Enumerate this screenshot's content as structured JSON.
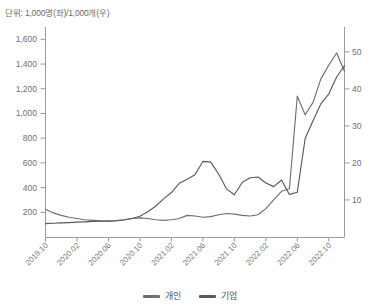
{
  "chart_data": {
    "type": "line",
    "title": "",
    "unit_note": "단위: 1,000명(좌)/1,000개(우)",
    "xlabel": "",
    "ylabel": "",
    "grid": false,
    "legend_position": "bottom-center",
    "x_tick_labels": [
      "2019.10",
      "2020.02",
      "2020.06",
      "2020.10",
      "2021.02",
      "2021.06",
      "2021.10",
      "2022.02",
      "2022.06",
      "2022.10"
    ],
    "x_period_start": "2019.10",
    "x_period_end": "2022.12",
    "left_axis": {
      "label": "1,000명",
      "ticks": [
        200,
        400,
        600,
        800,
        1000,
        1200,
        1400,
        1600
      ],
      "tick_labels": [
        "200",
        "400",
        "600",
        "800",
        "1,000",
        "1,200",
        "1,400",
        "1,600"
      ],
      "ylim": [
        0,
        1700
      ]
    },
    "right_axis": {
      "label": "1,000개",
      "ticks": [
        10,
        20,
        30,
        40,
        50
      ],
      "tick_labels": [
        "10",
        "20",
        "30",
        "40",
        "50"
      ],
      "ylim": [
        0,
        56.7
      ]
    },
    "series": [
      {
        "name": "개인",
        "axis": "left",
        "color": "#6e6e6e",
        "x": [
          "2019.10",
          "2019.11",
          "2019.12",
          "2020.01",
          "2020.02",
          "2020.03",
          "2020.04",
          "2020.05",
          "2020.06",
          "2020.07",
          "2020.08",
          "2020.09",
          "2020.10",
          "2020.11",
          "2020.12",
          "2021.01",
          "2021.02",
          "2021.03",
          "2021.04",
          "2021.05",
          "2021.06",
          "2021.07",
          "2021.08",
          "2021.09",
          "2021.10",
          "2021.11",
          "2021.12",
          "2022.01",
          "2022.02",
          "2022.03",
          "2022.04",
          "2022.05",
          "2022.06",
          "2022.07",
          "2022.08",
          "2022.09",
          "2022.10",
          "2022.11",
          "2022.12"
        ],
        "values": [
          225,
          195,
          175,
          160,
          150,
          140,
          135,
          130,
          128,
          132,
          140,
          150,
          155,
          150,
          140,
          135,
          140,
          150,
          175,
          170,
          160,
          165,
          180,
          190,
          185,
          175,
          170,
          180,
          230,
          300,
          370,
          390,
          1140,
          990,
          1090,
          1280,
          1390,
          1490,
          1340
        ]
      },
      {
        "name": "기업",
        "axis": "right",
        "color": "#5a5a5a",
        "x": [
          "2019.10",
          "2019.11",
          "2019.12",
          "2020.01",
          "2020.02",
          "2020.03",
          "2020.04",
          "2020.05",
          "2020.06",
          "2020.07",
          "2020.08",
          "2020.09",
          "2020.10",
          "2020.11",
          "2020.12",
          "2021.01",
          "2021.02",
          "2021.03",
          "2021.04",
          "2021.05",
          "2021.06",
          "2021.07",
          "2021.08",
          "2021.09",
          "2021.10",
          "2021.11",
          "2021.12",
          "2022.01",
          "2022.02",
          "2022.03",
          "2022.04",
          "2022.05",
          "2022.06",
          "2022.07",
          "2022.08",
          "2022.09",
          "2022.10",
          "2022.11",
          "2022.12"
        ],
        "values": [
          3.6,
          3.7,
          3.8,
          3.9,
          4.0,
          4.1,
          4.2,
          4.3,
          4.3,
          4.4,
          4.6,
          5.0,
          5.6,
          6.8,
          8.3,
          10.3,
          12.0,
          14.5,
          15.6,
          16.8,
          20.4,
          20.2,
          17.0,
          13.0,
          11.4,
          14.7,
          16.0,
          16.2,
          14.6,
          13.6,
          15.4,
          11.5,
          12.1,
          26.6,
          31.4,
          36.0,
          38.6,
          43.2,
          46.3
        ]
      }
    ]
  },
  "legend": {
    "items": [
      {
        "label": "개인",
        "color": "#6e6e6e"
      },
      {
        "label": "기업",
        "color": "#5a5a5a"
      }
    ]
  }
}
